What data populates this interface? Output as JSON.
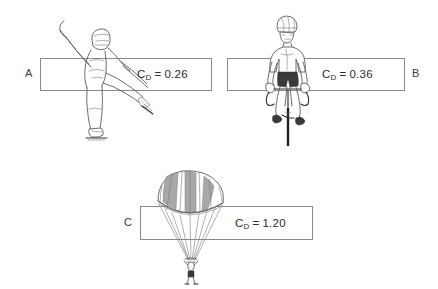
{
  "figure": {
    "background_color": "#ffffff",
    "line_color": "#5e5e5e",
    "box_border_color": "#8a8a8a",
    "text_color": "#2b2b2b"
  },
  "panels": [
    {
      "letter": "A",
      "letter_position": "left",
      "subject": "speed-skater",
      "symbol": "C",
      "subscript": "D",
      "equals": "=",
      "value": "0.26"
    },
    {
      "letter": "B",
      "letter_position": "right",
      "subject": "cyclist",
      "symbol": "C",
      "subscript": "D",
      "equals": "=",
      "value": "0.36"
    },
    {
      "letter": "C",
      "letter_position": "left",
      "subject": "parachutist",
      "symbol": "C",
      "subscript": "D",
      "equals": "=",
      "value": "1.20"
    }
  ]
}
